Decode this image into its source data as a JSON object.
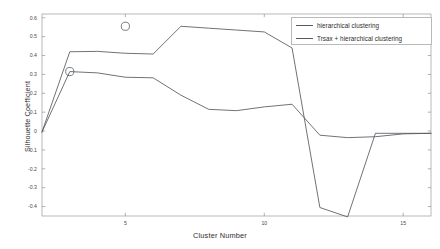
{
  "chart_data": {
    "type": "line",
    "title": "",
    "xlabel": "Cluster Number",
    "ylabel": "Silhouette Coefficient",
    "xlim": [
      2,
      16
    ],
    "ylim": [
      -0.45,
      0.62
    ],
    "xticks": [
      5,
      10,
      15
    ],
    "yticks": [
      0.6,
      0.5,
      0.4,
      0.3,
      0.2,
      0.1,
      0,
      -0.1,
      -0.2,
      -0.3,
      -0.4
    ],
    "ytick_labels": [
      "0.6",
      "0.5",
      "0.4",
      "0.3",
      "0.2",
      "0.1",
      "0",
      "-0.1",
      "-0.2",
      "-0.3",
      "-0.4"
    ],
    "xtick_labels": [
      "5",
      "10",
      "15"
    ],
    "grid": false,
    "legend_position": "upper right",
    "series": [
      {
        "name": "hierarchical clustering",
        "color": "#555a5e",
        "x": [
          2,
          3,
          4,
          5,
          6,
          7,
          8,
          9,
          10,
          11,
          12,
          13,
          14,
          15,
          16
        ],
        "y": [
          -0.005,
          0.42,
          0.422,
          0.412,
          0.408,
          0.555,
          0.545,
          0.535,
          0.525,
          0.44,
          -0.405,
          -0.455,
          -0.012,
          -0.012,
          -0.012
        ]
      },
      {
        "name": "Trsax + hierarchical clustering",
        "color": "#555a5e",
        "x": [
          2,
          3,
          4,
          5,
          6,
          7,
          8,
          9,
          10,
          11,
          12,
          13,
          14,
          15,
          16
        ],
        "y": [
          -0.005,
          0.315,
          0.308,
          0.285,
          0.282,
          0.19,
          0.115,
          0.108,
          0.128,
          0.142,
          -0.022,
          -0.035,
          -0.03,
          -0.015,
          -0.012
        ]
      }
    ],
    "markers": [
      {
        "name": "selected-point-trsax",
        "x": 3,
        "y": 0.315,
        "shape": "circle"
      },
      {
        "name": "selected-point-hierarchical",
        "x": 5,
        "y": 0.555,
        "shape": "circle"
      }
    ]
  },
  "legend": {
    "entries": [
      {
        "label": "hierarchical clustering"
      },
      {
        "label": "Trsax + hierarchical clustering"
      }
    ]
  }
}
